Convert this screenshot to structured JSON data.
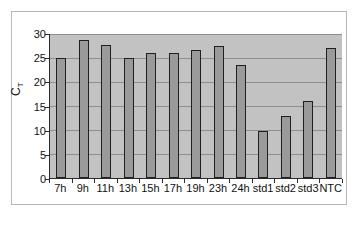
{
  "chart_data": {
    "type": "bar",
    "title": "",
    "xlabel": "",
    "ylabel": "CT",
    "ylim": [
      0,
      30
    ],
    "yticks": [
      0,
      5,
      10,
      15,
      20,
      25,
      30
    ],
    "grid": true,
    "legend": false,
    "categories": [
      "7h",
      "9h",
      "11h",
      "13h",
      "15h",
      "17h",
      "19h",
      "23h",
      "24h",
      "std1",
      "std2",
      "std3",
      "NTC"
    ],
    "values": [
      24.8,
      28.6,
      27.6,
      24.8,
      25.9,
      25.9,
      26.5,
      27.3,
      23.4,
      9.7,
      12.8,
      16.0,
      26.9
    ],
    "colors": {
      "bar_fill": "#9a9a9a",
      "bar_border": "#1f1f1f",
      "plot_background": "#c2c2c2",
      "gridline": "#8e8e8e",
      "axis": "#2b2b2b",
      "frame": "#b9b9b9",
      "text": "#111111",
      "page_background": "#ffffff"
    }
  },
  "axis": {
    "y_title_main": "C",
    "y_title_sub": "T"
  }
}
